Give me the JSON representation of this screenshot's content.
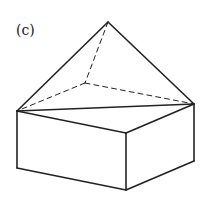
{
  "figure": {
    "label": "(c)",
    "stroke_color": "#222222",
    "vertices": {
      "apex": [
        108,
        22
      ],
      "hidden_back": [
        85,
        83
      ],
      "left": [
        17,
        111
      ],
      "right": [
        194,
        104
      ],
      "front_top": [
        126,
        133
      ],
      "left_bottom": [
        17,
        168
      ],
      "front_bottom": [
        126,
        190
      ],
      "right_bottom": [
        194,
        161
      ]
    },
    "solid_edges": [
      [
        "apex",
        "left"
      ],
      [
        "apex",
        "right"
      ],
      [
        "left",
        "right"
      ],
      [
        "left",
        "front_top"
      ],
      [
        "front_top",
        "right"
      ],
      [
        "left",
        "left_bottom"
      ],
      [
        "front_top",
        "front_bottom"
      ],
      [
        "right",
        "right_bottom"
      ],
      [
        "left_bottom",
        "front_bottom"
      ],
      [
        "front_bottom",
        "right_bottom"
      ]
    ],
    "dashed_edges": [
      [
        "apex",
        "hidden_back"
      ],
      [
        "hidden_back",
        "left"
      ],
      [
        "hidden_back",
        "right"
      ]
    ]
  }
}
